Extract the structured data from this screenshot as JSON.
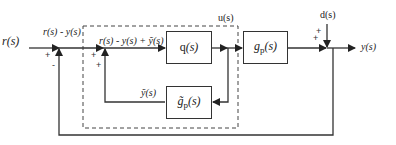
{
  "diagram": {
    "type": "block-diagram",
    "signals": {
      "input": "r(s)",
      "error": "r(s) - y(s)",
      "controller_input": "r(s) - y(s) + ỹ(s)",
      "control": "u(s)",
      "disturbance": "d(s)",
      "output": "y(s)",
      "model_output": "ỹ(s)"
    },
    "blocks": {
      "controller": {
        "name": "q",
        "arg": "(s)"
      },
      "plant": {
        "name": "g",
        "sub": "p",
        "arg": "(s)"
      },
      "model": {
        "name": "g̃",
        "sub": "p",
        "arg": "(s)"
      }
    },
    "summing_junctions": {
      "sj1": {
        "signs": [
          "+",
          "-"
        ]
      },
      "sj2": {
        "signs": [
          "+",
          "+"
        ]
      },
      "sj3": {
        "signs": [
          "+",
          "+"
        ]
      }
    },
    "colors": {
      "line": "#333333",
      "background": "#ffffff"
    }
  }
}
